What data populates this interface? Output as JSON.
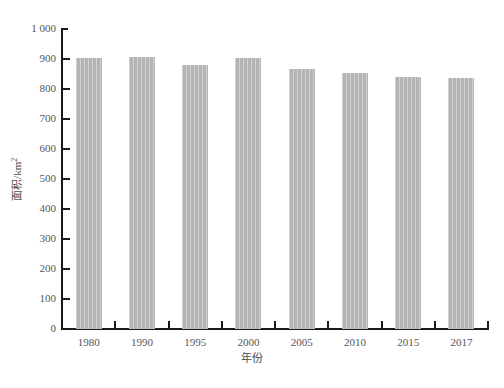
{
  "chart_data": {
    "type": "bar",
    "title": "",
    "subtitle": "",
    "xlabel": "年份",
    "ylabel": "面积/km",
    "ylabel_exponent": "2",
    "categories": [
      "1980",
      "1990",
      "1995",
      "2000",
      "2005",
      "2010",
      "2015",
      "2017"
    ],
    "values": [
      905,
      907,
      880,
      903,
      868,
      854,
      840,
      836
    ],
    "series": [
      {
        "name": "面积",
        "values": [
          905,
          907,
          880,
          903,
          868,
          854,
          840,
          836
        ]
      }
    ],
    "ylim": [
      0,
      1000
    ],
    "ytick_values": [
      0,
      100,
      200,
      300,
      400,
      500,
      600,
      700,
      800,
      900,
      1000
    ],
    "ytick_labels": [
      "0",
      "100",
      "200",
      "300",
      "400",
      "500",
      "600",
      "700",
      "800",
      "900",
      "1 000"
    ],
    "grid": false,
    "legend": false,
    "legend_position": "none",
    "bar_color": "#b4b4b4",
    "axis_color": "#1a1a1a",
    "text_color": "#4d4d4d",
    "background_color": "#ffffff"
  }
}
